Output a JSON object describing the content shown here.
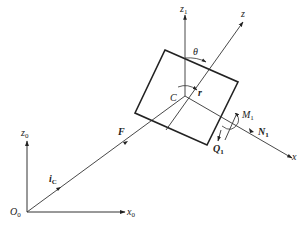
{
  "diagram": {
    "title": "",
    "colors": {
      "line": "#333333",
      "thick": "#222222",
      "background": "#ffffff"
    },
    "labels": {
      "z1": {
        "main": "z",
        "sub": "1"
      },
      "z": {
        "main": "z"
      },
      "theta": {
        "main": "θ"
      },
      "C": {
        "main": "C"
      },
      "r": {
        "main": "r"
      },
      "M1": {
        "main": "M",
        "sub": "1"
      },
      "N1": {
        "main": "N",
        "sub": "1"
      },
      "Q1": {
        "main": "Q",
        "sub": "1"
      },
      "x": {
        "main": "x"
      },
      "F": {
        "main": "F"
      },
      "iC": {
        "main": "i",
        "sub": "C"
      },
      "z0": {
        "main": "z",
        "sub": "0"
      },
      "O0": {
        "main": "O",
        "sub": "0"
      },
      "x0": {
        "main": "x",
        "sub": "0"
      }
    },
    "nodes": [
      {
        "id": "O0",
        "x": 27,
        "y": 212
      },
      {
        "id": "C",
        "x": 185,
        "y": 96
      }
    ],
    "edges": [
      {
        "from": "O0",
        "to": "x0-end",
        "label": "x0"
      },
      {
        "from": "O0",
        "to": "z0-end",
        "label": "z0"
      },
      {
        "from": "O0",
        "to": "C",
        "label": "F / iC"
      },
      {
        "from": "C",
        "to": "z1-end",
        "label": "z1"
      },
      {
        "from": "C",
        "to": "x-end",
        "label": "x"
      },
      {
        "from": "z-start",
        "to": "z-end",
        "label": "z"
      }
    ]
  }
}
